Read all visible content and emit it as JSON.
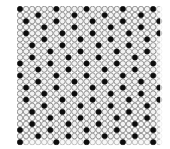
{
  "image": {
    "title": "Halftone dot lattice pattern",
    "kind": "abstract-dot-pattern",
    "width": 170,
    "height": 149,
    "background_color": "#ffffff"
  },
  "pattern": {
    "name": "circle-grid-with-black-lattice",
    "origin_x": 17,
    "origin_y": 6,
    "area_width": 145,
    "area_height": 140,
    "cell_pitch": 6.05,
    "columns": 24,
    "rows": 23,
    "base_circle": {
      "name": "light-gray-ring",
      "radius": 2.75,
      "fill_color": "#f2f2f2",
      "stroke_color": "#8d8d8d",
      "stroke_width": 0.9
    },
    "accent_circle": {
      "name": "black-dot",
      "radius": 2.7,
      "fill_color": "#0d0d0d",
      "stroke_color": "#0d0d0d",
      "stroke_width": 0.6
    },
    "accent_lattice": {
      "description": "black dots placed where (col*2 + row*5) mod 11 is below threshold, producing diagonal rows",
      "modulus": 11,
      "col_step": 2,
      "row_step": 5,
      "threshold": 2,
      "density_note": "roughly one black dot per 5-6 grid cells"
    },
    "edge_fade": {
      "enabled": true,
      "description": "outermost ring cells slightly lighter toward the right and bottom margins",
      "fade_color": "#ffffff"
    }
  },
  "colors": {
    "background": "#ffffff",
    "ring_fill": "#f2f2f2",
    "ring_stroke": "#8d8d8d",
    "dot": "#0d0d0d"
  }
}
